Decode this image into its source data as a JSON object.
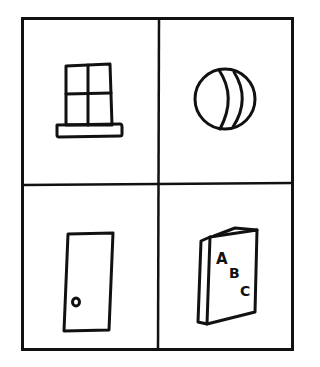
{
  "figure": {
    "type": "picture-grid",
    "rows": 2,
    "columns": 2,
    "line_color": "#111111",
    "background": "#ffffff",
    "cells": [
      {
        "position": "top-left",
        "object": "window",
        "description": "Four-pane window with a sill"
      },
      {
        "position": "top-right",
        "object": "ball",
        "description": "Round ball with curved stripes"
      },
      {
        "position": "bottom-left",
        "object": "door",
        "description": "Door with a round knob"
      },
      {
        "position": "bottom-right",
        "object": "book",
        "description": "Book with letters on cover"
      }
    ],
    "book_letters": [
      "A",
      "B",
      "C"
    ]
  }
}
